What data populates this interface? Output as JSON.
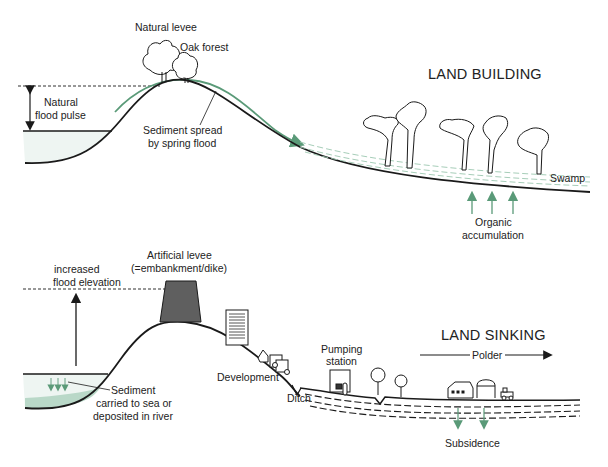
{
  "colors": {
    "line": "#1a1a1a",
    "green": "#5a9a78",
    "water": "#eef5f2",
    "sediment": "#b9d8c8",
    "levee_fill": "#5f5f5f",
    "swamp_dash": "#9cc7b0"
  },
  "top_panel": {
    "title": "LAND BUILDING",
    "labels": {
      "natural_levee": "Natural levee",
      "oak_forest": "Oak forest",
      "flood_pulse_1": "Natural",
      "flood_pulse_2": "flood pulse",
      "sediment_1": "Sediment spread",
      "sediment_2": "by spring flood",
      "swamp": "Swamp",
      "organic_1": "Organic",
      "organic_2": "accumulation"
    }
  },
  "bottom_panel": {
    "title": "LAND SINKING",
    "labels": {
      "artificial_levee_1": "Artificial levee",
      "artificial_levee_2": "(=embankment/dike)",
      "flood_elev_1": "increased",
      "flood_elev_2": "flood elevation",
      "sediment_1": "Sediment",
      "sediment_2": "carried to sea or",
      "sediment_3": "deposited in river",
      "development": "Development",
      "ditch": "Ditch",
      "pumping_1": "Pumping",
      "pumping_2": "station",
      "polder": "Polder",
      "subsidence": "Subsidence"
    }
  }
}
